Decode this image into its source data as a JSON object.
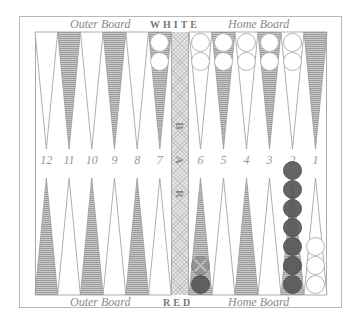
{
  "board": {
    "top_left_label": "Outer Board",
    "top_player": "WHITE",
    "top_right_label": "Home Board",
    "bottom_left_label": "Outer Board",
    "bottom_player": "RED",
    "bottom_right_label": "Home Board",
    "bar_letters": [
      "B",
      "A",
      "R"
    ]
  },
  "colors": {
    "frame": "#b8b8b8",
    "shaded_point": "#a8a8a8",
    "light_point": "#ffffff",
    "white_checker": "#ffffff",
    "red_checker": "#585858",
    "label": "#8a8a8a"
  },
  "point_numbers": [
    "12",
    "11",
    "10",
    "9",
    "8",
    "7",
    "6",
    "5",
    "4",
    "3",
    "2",
    "1"
  ],
  "top_points": [
    {
      "number": 12,
      "shade": "light",
      "checkers": 0,
      "color": null
    },
    {
      "number": 11,
      "shade": "dark",
      "checkers": 0,
      "color": null
    },
    {
      "number": 10,
      "shade": "light",
      "checkers": 0,
      "color": null
    },
    {
      "number": 9,
      "shade": "dark",
      "checkers": 0,
      "color": null
    },
    {
      "number": 8,
      "shade": "light",
      "checkers": 0,
      "color": null
    },
    {
      "number": 7,
      "shade": "dark",
      "checkers": 2,
      "color": "white"
    },
    {
      "number": 6,
      "shade": "light",
      "checkers": 2,
      "color": "white"
    },
    {
      "number": 5,
      "shade": "dark",
      "checkers": 2,
      "color": "white"
    },
    {
      "number": 4,
      "shade": "light",
      "checkers": 2,
      "color": "white"
    },
    {
      "number": 3,
      "shade": "dark",
      "checkers": 2,
      "color": "white"
    },
    {
      "number": 2,
      "shade": "light",
      "checkers": 2,
      "color": "white"
    },
    {
      "number": 1,
      "shade": "dark",
      "checkers": 0,
      "color": null
    }
  ],
  "bottom_points": [
    {
      "number": 12,
      "shade": "dark",
      "checkers": 0,
      "color": null
    },
    {
      "number": 11,
      "shade": "light",
      "checkers": 0,
      "color": null
    },
    {
      "number": 10,
      "shade": "dark",
      "checkers": 0,
      "color": null
    },
    {
      "number": 9,
      "shade": "light",
      "checkers": 0,
      "color": null
    },
    {
      "number": 8,
      "shade": "dark",
      "checkers": 0,
      "color": null
    },
    {
      "number": 7,
      "shade": "light",
      "checkers": 0,
      "color": null
    },
    {
      "number": 6,
      "shade": "dark",
      "checkers": 2,
      "color": "red",
      "ghost_top": true
    },
    {
      "number": 5,
      "shade": "light",
      "checkers": 0,
      "color": null
    },
    {
      "number": 4,
      "shade": "dark",
      "checkers": 0,
      "color": null
    },
    {
      "number": 3,
      "shade": "light",
      "checkers": 0,
      "color": null
    },
    {
      "number": 2,
      "shade": "dark",
      "checkers": 7,
      "color": "red"
    },
    {
      "number": 1,
      "shade": "light",
      "checkers": 3,
      "color": "white"
    }
  ]
}
